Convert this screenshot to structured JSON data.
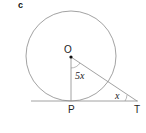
{
  "part_label": "c",
  "diagram": {
    "center_label": "O",
    "tangent_point_label": "P",
    "external_point_label": "T",
    "angle_at_center": "5x",
    "angle_at_T": "x",
    "colors": {
      "stroke": "#8a8a8a",
      "text": "#222222"
    }
  }
}
